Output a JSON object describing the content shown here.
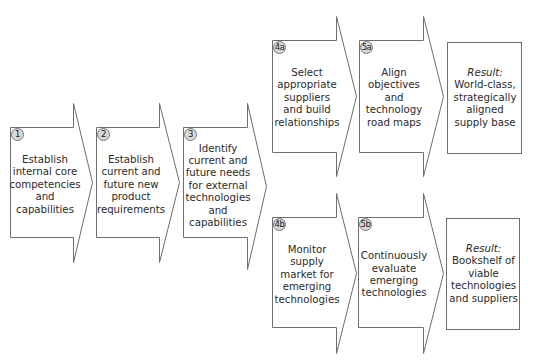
{
  "diagram": {
    "type": "process-flow",
    "colors": {
      "stroke": "#6e6e6e",
      "badge_fill": "#d8d8d8",
      "text": "#2a2a2a",
      "background": "#ffffff"
    },
    "steps": [
      {
        "id": "1",
        "badge": "1",
        "text": "Establish internal core competencies and capabilities"
      },
      {
        "id": "2",
        "badge": "2",
        "text": "Establish current and future new product requirements"
      },
      {
        "id": "3",
        "badge": "3",
        "text": "Identify current and future needs for external technologies and capabilities"
      },
      {
        "id": "4a",
        "badge": "4a",
        "text": "Select appropriate suppliers and build relationships"
      },
      {
        "id": "5a",
        "badge": "5a",
        "text": "Align objectives and technology road maps"
      },
      {
        "id": "4b",
        "badge": "4b",
        "text": "Monitor supply market for emerging technologies"
      },
      {
        "id": "5b",
        "badge": "5b",
        "text": "Continuously evaluate emerging technologies"
      }
    ],
    "results": [
      {
        "id": "result-a",
        "heading": "Result:",
        "text": "World-class, strategically aligned supply base"
      },
      {
        "id": "result-b",
        "heading": "Result:",
        "text": "Bookshelf of viable technologies and suppliers"
      }
    ],
    "connections": [
      [
        "1",
        "2"
      ],
      [
        "2",
        "3"
      ],
      [
        "3",
        "4a"
      ],
      [
        "3",
        "4b"
      ],
      [
        "4a",
        "5a"
      ],
      [
        "5a",
        "result-a"
      ],
      [
        "4b",
        "5b"
      ],
      [
        "5b",
        "result-b"
      ]
    ]
  }
}
